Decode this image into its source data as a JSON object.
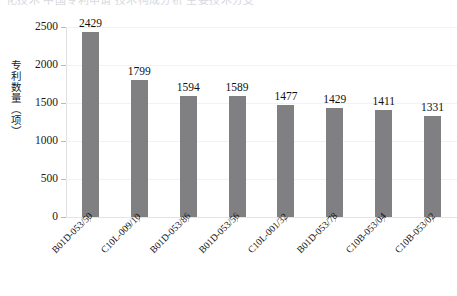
{
  "top_crop": {
    "text": "化技术  中国专利申请  技术构成分析  主要技术分支"
  },
  "chart_data": {
    "type": "bar",
    "title": "",
    "xlabel": "",
    "ylabel": "专利数量（项）",
    "categories": [
      "B01D-053/50",
      "C10L-009/10",
      "B01D-053/86",
      "B01D-053/56",
      "C10L-001/32",
      "B01D-053/78",
      "C10B-053/04",
      "C10B-053/02"
    ],
    "values": [
      2429,
      1799,
      1594,
      1589,
      1477,
      1429,
      1411,
      1331
    ],
    "value_labels": [
      "2429",
      "1799",
      "1594",
      "1589",
      "1477",
      "1429",
      "1411",
      "1331"
    ],
    "ylim": [
      0,
      2500
    ],
    "ytick_values": [
      0,
      500,
      1000,
      1500,
      2000,
      2500
    ],
    "ytick_labels": [
      "0",
      "500",
      "1000",
      "1500",
      "2000",
      "2500"
    ],
    "grid": true,
    "legend": "none",
    "bar_color": "#808083",
    "gridline_color": "#f2f2f4",
    "axis_color": "#e0e0e2",
    "label_rotation": -45
  }
}
